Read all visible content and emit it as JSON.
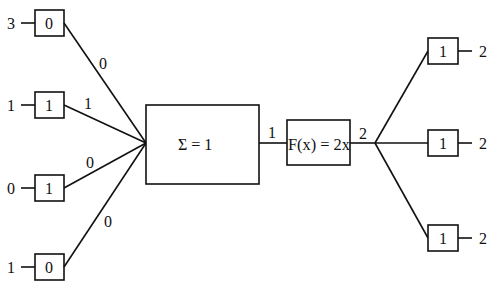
{
  "diagram": {
    "type": "perceptron-neuron",
    "inputs": [
      {
        "value": "3",
        "weight": "0",
        "product": "0",
        "cy": 23
      },
      {
        "value": "1",
        "weight": "1",
        "product": "1",
        "cy": 105
      },
      {
        "value": "0",
        "weight": "1",
        "product": "0",
        "cy": 188
      },
      {
        "value": "1",
        "weight": "0",
        "product": "0",
        "cy": 267
      }
    ],
    "sum_node": {
      "label": "Σ = 1",
      "output": "1"
    },
    "activation_node": {
      "label": "F(x) = 2x",
      "output": "2"
    },
    "outputs": [
      {
        "weight": "1",
        "value": "2",
        "cy": 51
      },
      {
        "weight": "1",
        "value": "2",
        "cy": 143
      },
      {
        "weight": "1",
        "value": "2",
        "cy": 238
      }
    ],
    "colors": {
      "stroke": "#111111",
      "background": "#ffffff"
    }
  }
}
